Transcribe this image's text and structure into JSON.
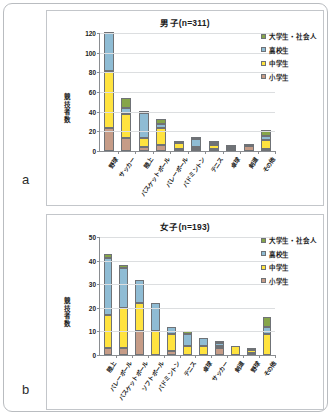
{
  "figure": {
    "panel_a_letter": "a",
    "panel_b_letter": "b"
  },
  "colors": {
    "elementary": "#c69c87",
    "juniorhigh": "#ffe33f",
    "highschool": "#8fbcd4",
    "university": "#84a martial"
  },
  "legend": {
    "items": [
      {
        "label": "大学生・社会人",
        "color": "#86a54a"
      },
      {
        "label": "高校生",
        "color": "#8fbcd4"
      },
      {
        "label": "中学生",
        "color": "#ffe33f"
      },
      {
        "label": "小学生",
        "color": "#c69c87"
      }
    ]
  },
  "chart_data": [
    {
      "type": "bar",
      "panel": "a",
      "title": "男子(n=311)",
      "xlabel": "",
      "ylabel": "競技者数",
      "ylim": [
        0,
        120
      ],
      "yticks": [
        0,
        20,
        40,
        60,
        80,
        100,
        120
      ],
      "grid": true,
      "legend_position": "top-right",
      "stacked": true,
      "categories": [
        "野球",
        "サッカー",
        "陸上",
        "バスケットボール",
        "バレーボール",
        "バドミントン",
        "テニス",
        "卓球",
        "剣道",
        "その他"
      ],
      "series": [
        {
          "name": "小学生",
          "color": "#c69c87",
          "values": [
            23,
            13,
            4,
            6,
            1,
            2,
            1,
            1,
            5,
            2
          ]
        },
        {
          "name": "中学生",
          "color": "#ffe33f",
          "values": [
            58,
            25,
            9,
            17,
            6,
            2,
            4,
            2,
            1,
            9
          ]
        },
        {
          "name": "高校生",
          "color": "#8fbcd4",
          "values": [
            40,
            6,
            26,
            4,
            1,
            8,
            1,
            1,
            0,
            4
          ]
        },
        {
          "name": "大学生・社会人",
          "color": "#86a54a",
          "values": [
            0,
            10,
            2,
            6,
            0,
            1,
            1,
            0,
            0,
            6
          ]
        }
      ],
      "totals": [
        121,
        54,
        41,
        33,
        8,
        13,
        7,
        4,
        6,
        21
      ]
    },
    {
      "type": "bar",
      "panel": "b",
      "title": "女子(n=193)",
      "xlabel": "",
      "ylabel": "競技者数",
      "ylim": [
        0,
        50
      ],
      "yticks": [
        0,
        10,
        20,
        30,
        40,
        50
      ],
      "grid": true,
      "legend_position": "top-right",
      "stacked": true,
      "categories": [
        "陸上",
        "バレーボール",
        "バスケットボール",
        "ソフトボール",
        "バドミントン",
        "テニス",
        "卓球",
        "サッカー",
        "剣道",
        "野球",
        "その他"
      ],
      "series": [
        {
          "name": "小学生",
          "color": "#c69c87",
          "values": [
            3,
            3,
            10,
            0,
            1.5,
            0,
            0,
            3,
            0,
            1,
            0
          ]
        },
        {
          "name": "中学生",
          "color": "#ffe33f",
          "values": [
            14,
            17,
            12,
            10,
            7.5,
            4,
            4,
            1,
            4,
            1,
            9
          ]
        },
        {
          "name": "高校生",
          "color": "#8fbcd4",
          "values": [
            24,
            17,
            10,
            12,
            3,
            5,
            3,
            1,
            0,
            1,
            3
          ]
        },
        {
          "name": "大学生・社会人",
          "color": "#86a54a",
          "values": [
            2,
            1,
            0,
            0,
            0,
            1,
            0,
            1,
            0,
            0,
            4
          ]
        }
      ],
      "totals": [
        43,
        38,
        32,
        22,
        12,
        10,
        7,
        6,
        4,
        3,
        16
      ]
    }
  ]
}
